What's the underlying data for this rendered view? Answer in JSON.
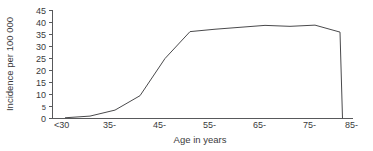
{
  "chart_data": {
    "type": "line",
    "title": "",
    "xlabel": "Age in years",
    "ylabel": "Incidence per 100 000",
    "categories": [
      "<30",
      "35-",
      "45-",
      "55-",
      "65-",
      "75-",
      "85-"
    ],
    "x_tick_labels": [
      "<30",
      "35-",
      "45-",
      "55-",
      "65-",
      "75-",
      "85-"
    ],
    "y_tick_labels": [
      "0",
      "5",
      "10",
      "15",
      "20",
      "25",
      "30",
      "35",
      "40",
      "45"
    ],
    "y_tick_values": [
      0,
      5,
      10,
      15,
      20,
      25,
      30,
      35,
      40,
      45
    ],
    "ylim": [
      0,
      45
    ],
    "xlim": [
      27.5,
      87.5
    ],
    "grid": false,
    "legend": false,
    "legend_position": "none",
    "series": [
      {
        "name": "Incidence",
        "x": [
          30,
          35,
          40,
          45,
          50,
          55,
          60,
          65,
          70,
          75,
          80,
          85,
          85.5
        ],
        "values": [
          0.3,
          1.0,
          3.5,
          9.5,
          25.0,
          36.2,
          37.2,
          38.0,
          38.8,
          38.4,
          38.9,
          36.0,
          0.0
        ]
      }
    ],
    "annotations": []
  },
  "figure": {
    "background_color": "#ffffff",
    "line_color": "#4a4a4c",
    "axis_color": "#58595b",
    "text_color": "#3a3a3c"
  }
}
